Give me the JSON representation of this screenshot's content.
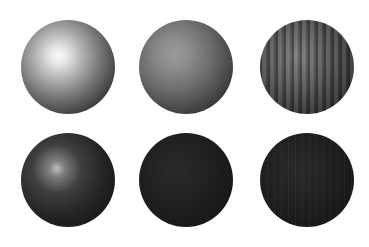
{
  "image": {
    "description": "Six rendered spheres arranged in a 2x3 grid on a white background, comparing shading and texture",
    "top_cut_text": "",
    "spheres": [
      {
        "row": 1,
        "col": 1,
        "appearance": "light gray glossy sphere with bright specular highlight"
      },
      {
        "row": 1,
        "col": 2,
        "appearance": "medium gray matte sphere with soft shading"
      },
      {
        "row": 1,
        "col": 3,
        "appearance": "gray sphere with vertical bumpy striped texture"
      },
      {
        "row": 2,
        "col": 1,
        "appearance": "dark glossy sphere with small highlight"
      },
      {
        "row": 2,
        "col": 2,
        "appearance": "very dark matte sphere"
      },
      {
        "row": 2,
        "col": 3,
        "appearance": "very dark sphere with faint striped texture"
      }
    ],
    "background_color": "#ffffff"
  }
}
